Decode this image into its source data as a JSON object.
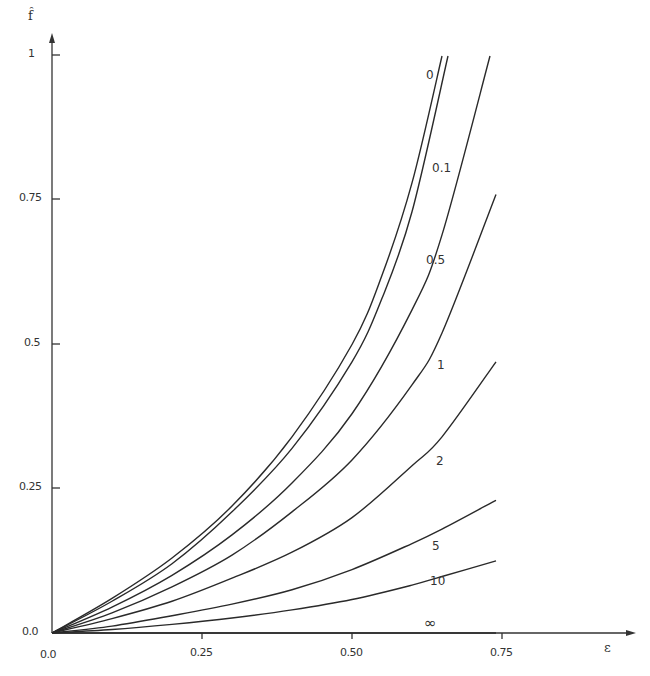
{
  "chart_data": {
    "type": "line",
    "title": "",
    "xlabel": "ε",
    "ylabel": "f̂",
    "xlim": [
      0,
      0.9
    ],
    "ylim": [
      0,
      1
    ],
    "grid": false,
    "x_ticks": [
      "0.0",
      "0.25",
      "0.50",
      "0.75"
    ],
    "y_ticks": [
      "0.0",
      "0.25",
      "0.5",
      "0.75",
      "1"
    ],
    "legend": "inline curve labels",
    "series": [
      {
        "name": "0",
        "x": [
          0,
          0.1,
          0.2,
          0.3,
          0.4,
          0.5,
          0.55,
          0.6,
          0.65
        ],
        "y": [
          0,
          0.06,
          0.13,
          0.22,
          0.34,
          0.5,
          0.62,
          0.78,
          1.0
        ]
      },
      {
        "name": "0.1",
        "x": [
          0,
          0.1,
          0.2,
          0.3,
          0.4,
          0.5,
          0.55,
          0.6,
          0.66
        ],
        "y": [
          0,
          0.055,
          0.12,
          0.21,
          0.32,
          0.47,
          0.58,
          0.73,
          1.0
        ]
      },
      {
        "name": "0.5",
        "x": [
          0,
          0.1,
          0.2,
          0.3,
          0.4,
          0.5,
          0.6,
          0.65,
          0.73
        ],
        "y": [
          0,
          0.045,
          0.1,
          0.17,
          0.26,
          0.38,
          0.56,
          0.69,
          1.0
        ]
      },
      {
        "name": "1",
        "x": [
          0,
          0.1,
          0.2,
          0.3,
          0.4,
          0.5,
          0.6,
          0.65,
          0.74
        ],
        "y": [
          0,
          0.035,
          0.08,
          0.135,
          0.21,
          0.3,
          0.43,
          0.52,
          0.76
        ]
      },
      {
        "name": "2",
        "x": [
          0,
          0.1,
          0.2,
          0.3,
          0.4,
          0.5,
          0.6,
          0.65,
          0.74
        ],
        "y": [
          0,
          0.025,
          0.055,
          0.095,
          0.14,
          0.2,
          0.29,
          0.34,
          0.47
        ]
      },
      {
        "name": "5",
        "x": [
          0,
          0.1,
          0.2,
          0.3,
          0.4,
          0.5,
          0.6,
          0.65,
          0.74
        ],
        "y": [
          0,
          0.012,
          0.03,
          0.05,
          0.075,
          0.11,
          0.155,
          0.18,
          0.23
        ]
      },
      {
        "name": "10",
        "x": [
          0,
          0.1,
          0.2,
          0.3,
          0.4,
          0.5,
          0.6,
          0.65,
          0.74
        ],
        "y": [
          0,
          0.006,
          0.015,
          0.026,
          0.04,
          0.058,
          0.083,
          0.098,
          0.125
        ]
      },
      {
        "name": "∞",
        "x": [
          0,
          0.74
        ],
        "y": [
          0,
          0
        ]
      }
    ]
  },
  "axes": {
    "x_title": "ε",
    "y_title": "f̂",
    "x_tick_labels": [
      "0.0",
      "0.25",
      "0.50",
      "0.75"
    ],
    "y_tick_labels": [
      "0.0",
      "0.25",
      "0.5",
      "0.75",
      "1"
    ]
  },
  "curve_labels": [
    "0",
    "0.1",
    "0.5",
    "1",
    "2",
    "5",
    "10",
    "∞"
  ],
  "colors": {
    "line": "#2a2a2a",
    "axis": "#333333",
    "background": "#ffffff"
  }
}
